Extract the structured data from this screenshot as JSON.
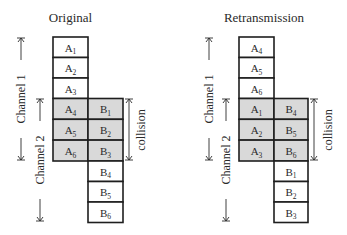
{
  "colors": {
    "background": "#ffffff",
    "cell_fill": "#ffffff",
    "collision_fill": "#d9d9d9",
    "stroke": "#1e1e1e",
    "text": "#2a2a2a"
  },
  "diagrams": [
    {
      "title": "Original",
      "channel1_label": "Channel 1",
      "channel2_label": "Channel 2",
      "collision_label": "collision",
      "column_a": [
        {
          "base": "A",
          "sub": "1"
        },
        {
          "base": "A",
          "sub": "2"
        },
        {
          "base": "A",
          "sub": "3"
        },
        {
          "base": "A",
          "sub": "4"
        },
        {
          "base": "A",
          "sub": "5"
        },
        {
          "base": "A",
          "sub": "6"
        }
      ],
      "column_b": [
        {
          "base": "B",
          "sub": "1"
        },
        {
          "base": "B",
          "sub": "2"
        },
        {
          "base": "B",
          "sub": "3"
        },
        {
          "base": "B",
          "sub": "4"
        },
        {
          "base": "B",
          "sub": "5"
        },
        {
          "base": "B",
          "sub": "6"
        }
      ]
    },
    {
      "title": "Retransmission",
      "channel1_label": "Channel 1",
      "channel2_label": "Channel 2",
      "collision_label": "collision",
      "column_a": [
        {
          "base": "A",
          "sub": "4"
        },
        {
          "base": "A",
          "sub": "5"
        },
        {
          "base": "A",
          "sub": "6"
        },
        {
          "base": "A",
          "sub": "1"
        },
        {
          "base": "A",
          "sub": "2"
        },
        {
          "base": "A",
          "sub": "3"
        }
      ],
      "column_b": [
        {
          "base": "B",
          "sub": "4"
        },
        {
          "base": "B",
          "sub": "5"
        },
        {
          "base": "B",
          "sub": "6"
        },
        {
          "base": "B",
          "sub": "1"
        },
        {
          "base": "B",
          "sub": "2"
        },
        {
          "base": "B",
          "sub": "3"
        }
      ]
    }
  ]
}
